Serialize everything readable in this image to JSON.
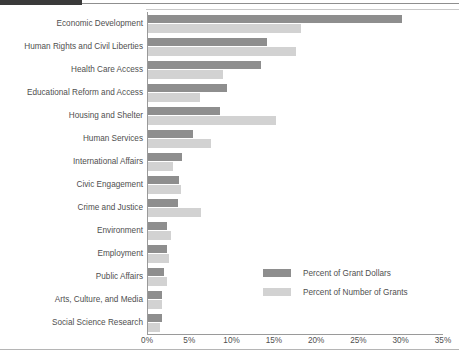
{
  "chart_data": {
    "type": "bar",
    "orientation": "horizontal",
    "title": "",
    "subtitle": "",
    "xlabel": "",
    "ylabel": "",
    "xlim": [
      0,
      35
    ],
    "xunit": "%",
    "grid": false,
    "legend_position": "inside-bottom-right",
    "xticks": [
      "0%",
      "5%",
      "10%",
      "15%",
      "20%",
      "25%",
      "30%",
      "35%"
    ],
    "xtick_values": [
      0,
      5,
      10,
      15,
      20,
      25,
      30,
      35
    ],
    "categories": [
      "Economic Development",
      "Human Rights and Civil Liberties",
      "Health Care Access",
      "Educational Reform and Access",
      "Housing and Shelter",
      "Human Services",
      "International Affairs",
      "Civic Engagement",
      "Crime and Justice",
      "Environment",
      "Employment",
      "Public Affairs",
      "Arts, Culture, and Media",
      "Social Science Research"
    ],
    "series": [
      {
        "name": "Percent of Grant Dollars",
        "color": "#8e8e8e",
        "values": [
          30.0,
          14.1,
          13.4,
          9.4,
          8.5,
          5.3,
          4.0,
          3.7,
          3.6,
          2.3,
          2.2,
          1.9,
          1.7,
          1.6
        ]
      },
      {
        "name": "Percent of Number of Grants",
        "color": "#d2d2d2",
        "values": [
          18.1,
          17.5,
          8.9,
          6.2,
          15.1,
          7.5,
          2.9,
          3.9,
          6.3,
          2.7,
          2.5,
          2.2,
          1.7,
          1.4
        ]
      }
    ]
  },
  "legend": {
    "items": [
      {
        "label": "Percent of Grant Dollars",
        "color": "#8e8e8e"
      },
      {
        "label": "Percent of Number of Grants",
        "color": "#d2d2d2"
      }
    ]
  }
}
